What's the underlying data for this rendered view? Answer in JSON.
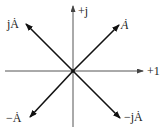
{
  "diagram": {
    "type": "phasor-diagram",
    "axes": {
      "real_label": "+1",
      "imag_label": "+j"
    },
    "phasors": [
      {
        "id": "A",
        "label": "Ȧ",
        "direction": "upper-right"
      },
      {
        "id": "jA",
        "label": "jȦ",
        "direction": "upper-left"
      },
      {
        "id": "negA",
        "label": "−Ȧ",
        "direction": "lower-left"
      },
      {
        "id": "negjA",
        "label": "−jȦ",
        "direction": "lower-right"
      }
    ],
    "colors": {
      "axis": "#555555",
      "vector": "#111111",
      "background": "#ffffff"
    }
  }
}
